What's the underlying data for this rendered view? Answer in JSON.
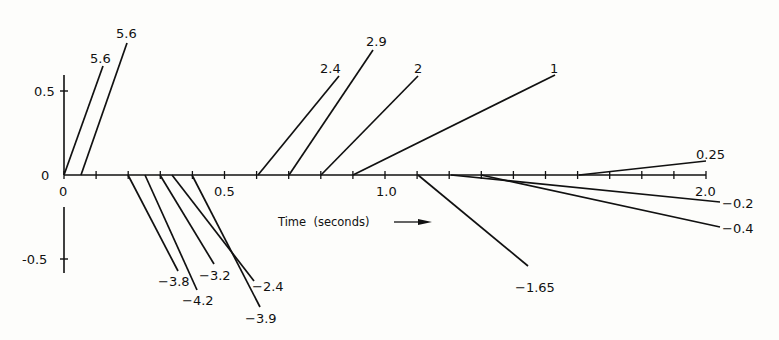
{
  "chart_data": {
    "type": "line",
    "title": "",
    "xlabel": "Time (seconds)",
    "ylabel": "",
    "xlim": [
      0,
      2.0
    ],
    "ylim": [
      -0.55,
      0.7
    ],
    "grid": false,
    "legend": "none",
    "x_ticks": [
      0,
      0.1,
      0.2,
      0.3,
      0.4,
      0.5,
      0.6,
      0.7,
      0.8,
      0.9,
      1.0,
      1.1,
      1.2,
      1.3,
      1.4,
      1.5,
      1.6,
      1.7,
      1.8,
      1.9,
      2.0
    ],
    "x_tick_labels": [
      "0",
      "0.5",
      "1.0",
      "2.0"
    ],
    "y_tick_labels": [
      "0.5",
      "0",
      "-0.5"
    ],
    "series": [
      {
        "name": "5.6",
        "start_t": 0.0,
        "slope": 5.6
      },
      {
        "name": "5.6",
        "start_t": 0.05,
        "slope": 5.6
      },
      {
        "name": "-3.8",
        "start_t": 0.2,
        "slope": -3.8
      },
      {
        "name": "-4.2",
        "start_t": 0.25,
        "slope": -4.2
      },
      {
        "name": "-3.2",
        "start_t": 0.3,
        "slope": -3.2
      },
      {
        "name": "-2.4",
        "start_t": 0.35,
        "slope": -2.4
      },
      {
        "name": "-3.9",
        "start_t": 0.4,
        "slope": -3.9
      },
      {
        "name": "2.4",
        "start_t": 0.6,
        "slope": 2.4
      },
      {
        "name": "2.9",
        "start_t": 0.7,
        "slope": 2.9
      },
      {
        "name": "2",
        "start_t": 0.8,
        "slope": 2
      },
      {
        "name": "1",
        "start_t": 0.9,
        "slope": 1
      },
      {
        "name": "-1.65",
        "start_t": 1.1,
        "slope": -1.65
      },
      {
        "name": "-0.2",
        "start_t": 1.2,
        "slope": -0.2
      },
      {
        "name": "-0.4",
        "start_t": 1.3,
        "slope": -0.4
      },
      {
        "name": "0.25",
        "start_t": 1.6,
        "slope": 0.25
      }
    ]
  },
  "axes": {
    "y_label_05": "0.5",
    "y_label_0": "0",
    "y_label_neg05": "-0.5",
    "x_label_0": "0",
    "x_label_05": "0.5",
    "x_label_10": "1.0",
    "x_label_20": "2.0",
    "x_title": "Time  (seconds)"
  },
  "segments": [
    {
      "label": "5.6",
      "x1": 64,
      "y1": 175,
      "x2": 103,
      "y2": 66,
      "lx": 90,
      "ly": 63
    },
    {
      "label": "5.6",
      "x1": 81,
      "y1": 175,
      "x2": 127,
      "y2": 43,
      "lx": 116,
      "ly": 38
    },
    {
      "label": "-3.8",
      "x1": 128,
      "y1": 175,
      "x2": 178,
      "y2": 271,
      "lx": 158,
      "ly": 286
    },
    {
      "label": "-4.2",
      "x1": 145,
      "y1": 175,
      "x2": 197,
      "y2": 290,
      "lx": 182,
      "ly": 305
    },
    {
      "label": "-3.2",
      "x1": 160,
      "y1": 175,
      "x2": 214,
      "y2": 264,
      "lx": 199,
      "ly": 280
    },
    {
      "label": "-2.4",
      "x1": 172,
      "y1": 175,
      "x2": 254,
      "y2": 281,
      "lx": 252,
      "ly": 291
    },
    {
      "label": "-3.9",
      "x1": 192,
      "y1": 175,
      "x2": 260,
      "y2": 307,
      "lx": 245,
      "ly": 323
    },
    {
      "label": "2.4",
      "x1": 258,
      "y1": 175,
      "x2": 339,
      "y2": 76,
      "lx": 320,
      "ly": 73
    },
    {
      "label": "2.9",
      "x1": 289,
      "y1": 175,
      "x2": 373,
      "y2": 50,
      "lx": 366,
      "ly": 46
    },
    {
      "label": "2",
      "x1": 321,
      "y1": 175,
      "x2": 418,
      "y2": 76,
      "lx": 414,
      "ly": 73
    },
    {
      "label": "1",
      "x1": 353,
      "y1": 175,
      "x2": 555,
      "y2": 75,
      "lx": 550,
      "ly": 73
    },
    {
      "label": "-1.65",
      "x1": 418,
      "y1": 175,
      "x2": 528,
      "y2": 266,
      "lx": 515,
      "ly": 292
    },
    {
      "label": "-0.2",
      "x1": 451,
      "y1": 175,
      "x2": 720,
      "y2": 202,
      "lx": 722,
      "ly": 208
    },
    {
      "label": "-0.4",
      "x1": 481,
      "y1": 175,
      "x2": 720,
      "y2": 227,
      "lx": 722,
      "ly": 233
    },
    {
      "label": "0.25",
      "x1": 579,
      "y1": 175,
      "x2": 706,
      "y2": 161,
      "lx": 696,
      "ly": 159
    }
  ],
  "colors": {
    "ink": "#111111",
    "paper": "#fdfdfb"
  }
}
